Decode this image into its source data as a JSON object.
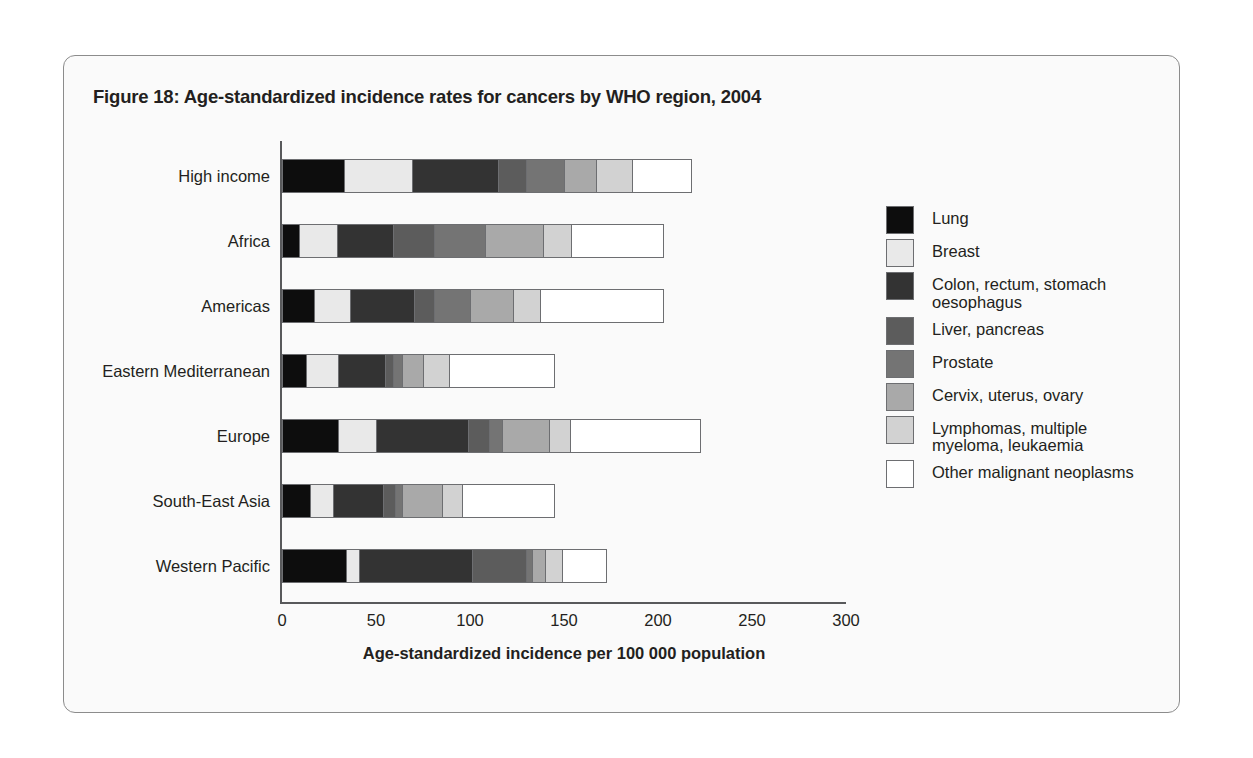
{
  "figure": {
    "title": "Figure 18: Age-standardized incidence rates for cancers by WHO region, 2004"
  },
  "chart_data": {
    "type": "bar",
    "orientation": "horizontal",
    "stacked": true,
    "title": "Figure 18: Age-standardized incidence rates for cancers by WHO region, 2004",
    "xlabel": "Age-standardized incidence per 100 000 population",
    "ylabel": "",
    "xlim": [
      0,
      300
    ],
    "xticks": [
      "0",
      "50",
      "100",
      "150",
      "200",
      "250",
      "300"
    ],
    "grid": false,
    "legend_position": "right",
    "categories": [
      "High income",
      "Africa",
      "Americas",
      "Eastern Mediterranean",
      "Europe",
      "South-East Asia",
      "Western Pacific"
    ],
    "series": [
      {
        "name": "Lung",
        "color": "#0d0d0d",
        "values": [
          33,
          9,
          17,
          13,
          30,
          15,
          34
        ]
      },
      {
        "name": "Colon, rectum, stomach\noesophagus",
        "color": "#e9e9e9",
        "legend_order": 2,
        "values": [
          36,
          20,
          19,
          17,
          20,
          12,
          7
        ]
      },
      {
        "name": "Colon, rectum, stomach oesophagus",
        "color": "#333333",
        "values": [
          46,
          30,
          34,
          25,
          49,
          27,
          60
        ]
      },
      {
        "name": "Liver, pancreas",
        "color": "#5c5c5c",
        "values": [
          15,
          22,
          11,
          4,
          11,
          6,
          29
        ]
      },
      {
        "name": "Prostate",
        "color": "#747474",
        "values": [
          20,
          27,
          19,
          5,
          7,
          4,
          3
        ]
      },
      {
        "name": "Cervix, uterus, ovary",
        "color": "#a9a9a9",
        "values": [
          17,
          31,
          23,
          11,
          25,
          21,
          7
        ]
      },
      {
        "name": "Lymphomas, multiple\nmyeloma, leukaemia",
        "color": "#d2d2d2",
        "values": [
          19,
          15,
          14,
          14,
          11,
          11,
          9
        ]
      },
      {
        "name": "Other malignant neoplasms",
        "color": "#ffffff",
        "values": [
          32,
          49,
          66,
          56,
          70,
          49,
          24
        ]
      }
    ],
    "legend_entries": [
      {
        "label": "Lung",
        "color": "#0d0d0d"
      },
      {
        "label": "Breast",
        "color": "#e9e9e9"
      },
      {
        "label": "Colon, rectum, stomach\noesophagus",
        "color": "#333333"
      },
      {
        "label": "Liver, pancreas",
        "color": "#5c5c5c"
      },
      {
        "label": "Prostate",
        "color": "#747474"
      },
      {
        "label": "Cervix, uterus, ovary",
        "color": "#a9a9a9"
      },
      {
        "label": "Lymphomas, multiple\nmyeloma, leukaemia",
        "color": "#d2d2d2"
      },
      {
        "label": "Other malignant neoplasms",
        "color": "#ffffff"
      }
    ],
    "rows": [
      {
        "category": "High income",
        "segments": [
          33,
          36,
          46,
          15,
          20,
          17,
          19,
          32
        ],
        "total": 218
      },
      {
        "category": "Africa",
        "segments": [
          9,
          20,
          30,
          22,
          27,
          31,
          15,
          49
        ],
        "total": 203
      },
      {
        "category": "Americas",
        "segments": [
          17,
          19,
          34,
          11,
          19,
          23,
          14,
          66
        ],
        "total": 203
      },
      {
        "category": "Eastern Mediterranean",
        "segments": [
          13,
          17,
          25,
          4,
          5,
          11,
          14,
          56
        ],
        "total": 145
      },
      {
        "category": "Europe",
        "segments": [
          30,
          20,
          49,
          11,
          7,
          25,
          11,
          70
        ],
        "total": 223
      },
      {
        "category": "South-East Asia",
        "segments": [
          15,
          12,
          27,
          6,
          4,
          21,
          11,
          49
        ],
        "total": 145
      },
      {
        "category": "Western Pacific",
        "segments": [
          34,
          7,
          60,
          29,
          3,
          7,
          9,
          24
        ],
        "total": 173
      }
    ]
  }
}
